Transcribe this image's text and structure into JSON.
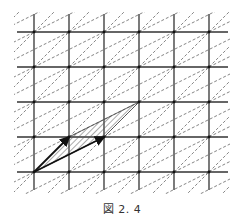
{
  "caption": "図 2. 4",
  "colors": {
    "grid": "#333333",
    "dashed": "#777777",
    "vector": "#111111",
    "hatch": "#555555",
    "background": "#ffffff"
  },
  "lattice": {
    "origin_px": [
      34,
      172
    ],
    "cell_px": 35,
    "columns_x": [
      34,
      69,
      104,
      139,
      174,
      209
    ],
    "rows_y": [
      32,
      67,
      102,
      137,
      172
    ],
    "vertical_extent_y": [
      14,
      190
    ],
    "horizontal_extent_x": [
      17,
      228
    ]
  },
  "basis_vectors": [
    {
      "name": "a",
      "components": [
        1,
        1
      ]
    },
    {
      "name": "b",
      "components": [
        2,
        1
      ]
    }
  ],
  "hatched_parallelogram": {
    "vertices_lattice": [
      [
        0,
        0
      ],
      [
        1,
        1
      ],
      [
        3,
        2
      ],
      [
        2,
        1
      ]
    ]
  }
}
